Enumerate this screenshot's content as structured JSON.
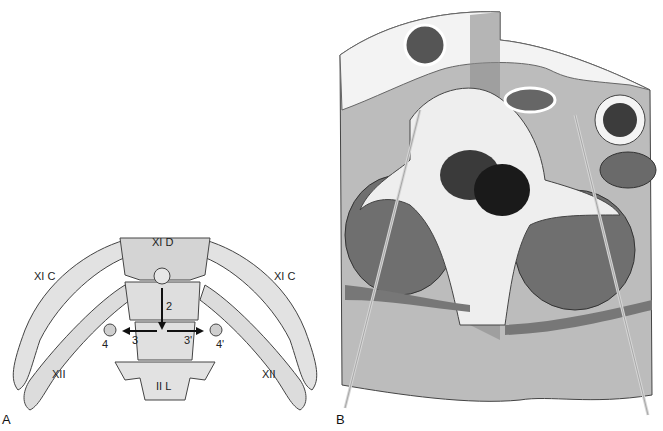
{
  "figure": {
    "panels": [
      {
        "letter": "A",
        "description": "Posterior view of lower thoracic/upper lumbar spine with ribs",
        "labels": {
          "xi_d": "XI D",
          "xi_c_left": "XI C",
          "xi_c_right": "XI C",
          "xii_left": "XII",
          "xii_right": "XII",
          "ii_l": "II L",
          "n2": "2",
          "n3": "3",
          "n3p": "3'",
          "n4": "4",
          "n4p": "4'"
        }
      },
      {
        "letter": "B",
        "description": "Axial cross-section of vertebra with two needle trajectories"
      }
    ]
  },
  "colors": {
    "bone": "#e4e4e4",
    "bone_shadow": "#bdbdbd",
    "outline": "#444444",
    "muscle": "#6e6e6e",
    "muscle_dark": "#555555",
    "fat": "#f4f4f4",
    "tissue": "#a9a9a9",
    "skin": "#cfcfcf",
    "needle": "#d9d9d9"
  }
}
